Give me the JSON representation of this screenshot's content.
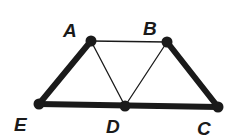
{
  "diagram": {
    "points": [
      {
        "id": "A",
        "label": "A",
        "x": 91,
        "y": 41,
        "lx": 63,
        "ly": 37
      },
      {
        "id": "B",
        "label": "B",
        "x": 167,
        "y": 42,
        "lx": 143,
        "ly": 35
      },
      {
        "id": "C",
        "label": "C",
        "x": 218,
        "y": 107,
        "lx": 197,
        "ly": 135
      },
      {
        "id": "D",
        "label": "D",
        "x": 125,
        "y": 106,
        "lx": 106,
        "ly": 133
      },
      {
        "id": "E",
        "label": "E",
        "x": 39,
        "y": 104,
        "lx": 14,
        "ly": 131
      }
    ],
    "segments": [
      {
        "from": "A",
        "to": "E",
        "weight": "thick"
      },
      {
        "from": "E",
        "to": "C",
        "weight": "thick"
      },
      {
        "from": "B",
        "to": "C",
        "weight": "thick"
      },
      {
        "from": "A",
        "to": "B",
        "weight": "thin"
      },
      {
        "from": "A",
        "to": "D",
        "weight": "thin"
      },
      {
        "from": "B",
        "to": "D",
        "weight": "thin"
      }
    ],
    "colors": {
      "stroke": "#1a1a1a",
      "background": "#ffffff"
    }
  }
}
